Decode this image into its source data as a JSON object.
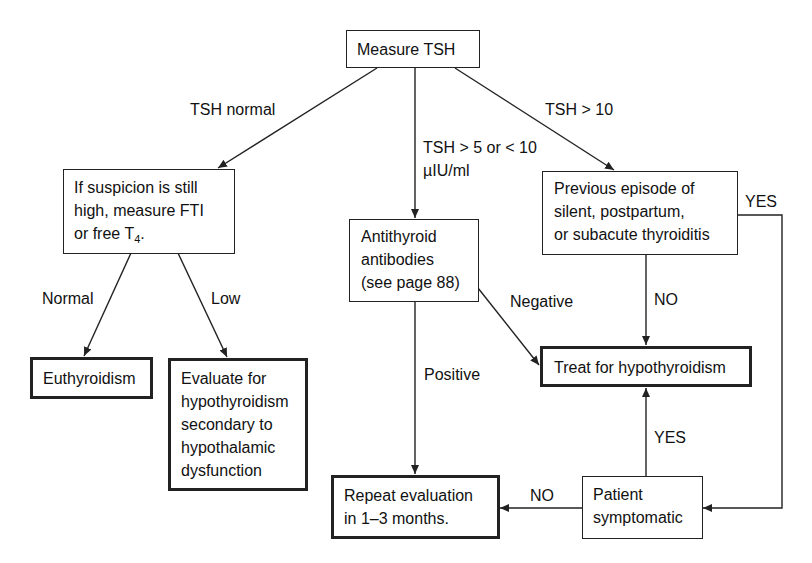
{
  "diagram": {
    "type": "flowchart",
    "nodes": {
      "measure_tsh": {
        "lines": [
          "Measure TSH"
        ]
      },
      "suspicion": {
        "lines": [
          "If suspicion is still",
          "high, measure FTI"
        ],
        "last_line_pre": "or free T",
        "last_line_sub": "4",
        "last_line_post": "."
      },
      "antibodies": {
        "lines": [
          "Antithyroid",
          "antibodies",
          "(see page 88)"
        ]
      },
      "previous_episode": {
        "lines": [
          "Previous episode of",
          "silent, postpartum,",
          "or subacute thyroiditis"
        ]
      },
      "euthyroidism": {
        "lines": [
          "Euthyroidism"
        ]
      },
      "evaluate": {
        "lines": [
          "Evaluate for",
          "hypothyroidism",
          "secondary to",
          "hypothalamic",
          "dysfunction"
        ]
      },
      "treat": {
        "lines": [
          "Treat for hypothyroidism"
        ]
      },
      "repeat": {
        "lines": [
          "Repeat evaluation",
          "in 1–3 months."
        ]
      },
      "symptomatic": {
        "lines": [
          "Patient",
          "symptomatic"
        ]
      }
    },
    "edge_labels": {
      "tsh_normal": "TSH normal",
      "tsh_mid_1": "TSH > 5 or < 10",
      "tsh_mid_2": "µIU/ml",
      "tsh_high": "TSH > 10",
      "normal": "Normal",
      "low": "Low",
      "negative": "Negative",
      "positive": "Positive",
      "prev_no": "NO",
      "prev_yes": "YES",
      "symp_yes": "YES",
      "symp_no": "NO"
    },
    "edges": [
      {
        "from": "measure_tsh",
        "to": "suspicion",
        "label": "TSH normal"
      },
      {
        "from": "measure_tsh",
        "to": "antibodies",
        "label": "TSH > 5 or < 10 µIU/ml"
      },
      {
        "from": "measure_tsh",
        "to": "previous_episode",
        "label": "TSH > 10"
      },
      {
        "from": "suspicion",
        "to": "euthyroidism",
        "label": "Normal"
      },
      {
        "from": "suspicion",
        "to": "evaluate",
        "label": "Low"
      },
      {
        "from": "antibodies",
        "to": "treat",
        "label": "Negative"
      },
      {
        "from": "antibodies",
        "to": "repeat",
        "label": "Positive"
      },
      {
        "from": "previous_episode",
        "to": "treat",
        "label": "NO"
      },
      {
        "from": "previous_episode",
        "to": "symptomatic",
        "label": "YES"
      },
      {
        "from": "symptomatic",
        "to": "treat",
        "label": "YES"
      },
      {
        "from": "symptomatic",
        "to": "repeat",
        "label": "NO"
      }
    ]
  }
}
